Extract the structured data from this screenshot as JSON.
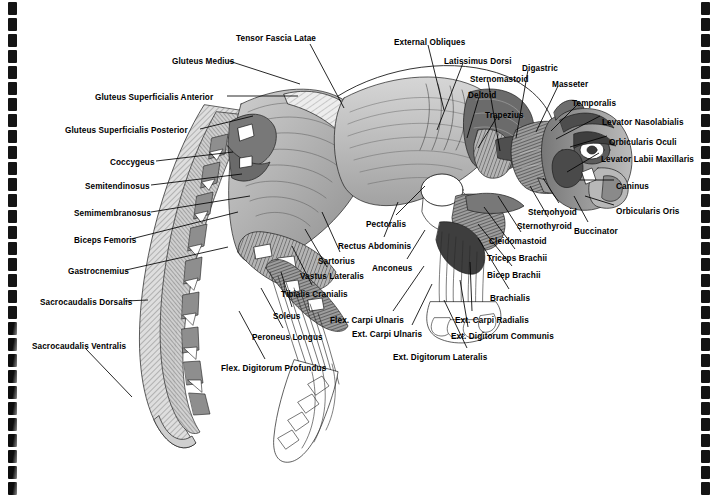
{
  "document": {
    "type": "anatomical-illustration",
    "subject": "Cat superficial musculature — lateral view",
    "page_background": "#ffffff",
    "ink_color": "#000000",
    "binding": {
      "style": "spiral-comb",
      "left_holes": 31,
      "right_holes": 31
    }
  },
  "labels": [
    {
      "id": "tensor-fascia-latae",
      "text": "Tensor Fascia Latae",
      "x": 236,
      "y": 34,
      "align": "left",
      "lx": 310,
      "ly": 44,
      "tx": 344,
      "ty": 108
    },
    {
      "id": "gluteus-medius",
      "text": "Gluteus Medius",
      "x": 172,
      "y": 57,
      "align": "left",
      "lx": 229,
      "ly": 61,
      "tx": 300,
      "ty": 84
    },
    {
      "id": "gluteus-superficialis-anterior",
      "text": "Gluteus Superficialis Anterior",
      "x": 95,
      "y": 93,
      "align": "left",
      "lx": 227,
      "ly": 96,
      "tx": 298,
      "ty": 96
    },
    {
      "id": "gluteus-superficialis-posterior",
      "text": "Gluteus Superficialis Posterior",
      "x": 65,
      "y": 126,
      "align": "left",
      "lx": 200,
      "ly": 129,
      "tx": 253,
      "ty": 116
    },
    {
      "id": "coccygeus",
      "text": "Coccygeus",
      "x": 110,
      "y": 158,
      "align": "left",
      "lx": 156,
      "ly": 161,
      "tx": 233,
      "ty": 152
    },
    {
      "id": "semitendinosus",
      "text": "Semitendinosus",
      "x": 85,
      "y": 182,
      "align": "left",
      "lx": 151,
      "ly": 185,
      "tx": 242,
      "ty": 174
    },
    {
      "id": "semimembranosus",
      "text": "Semimembranosus",
      "x": 74,
      "y": 209,
      "align": "left",
      "lx": 151,
      "ly": 212,
      "tx": 250,
      "ty": 196
    },
    {
      "id": "biceps-femoris",
      "text": "Biceps Femoris",
      "x": 74,
      "y": 236,
      "align": "left",
      "lx": 131,
      "ly": 239,
      "tx": 238,
      "ty": 212
    },
    {
      "id": "gastrocnemius",
      "text": "Gastrocnemius",
      "x": 68,
      "y": 267,
      "align": "left",
      "lx": 126,
      "ly": 270,
      "tx": 228,
      "ty": 247
    },
    {
      "id": "sacrocaudalis-dorsalis",
      "text": "Sacrocaudalis Dorsalis",
      "x": 40,
      "y": 298,
      "align": "left",
      "lx": 125,
      "ly": 301,
      "tx": 148,
      "ty": 300
    },
    {
      "id": "sacrocaudalis-ventralis",
      "text": "Sacrocaudalis Ventralis",
      "x": 32,
      "y": 342,
      "align": "left",
      "lx": 86,
      "ly": 349,
      "tx": 132,
      "ty": 397
    },
    {
      "id": "flex-digitorum-profundus",
      "text": "Flex. Digitorum Profundus",
      "x": 221,
      "y": 364,
      "align": "left",
      "lx": 265,
      "ly": 359,
      "tx": 239,
      "ty": 311
    },
    {
      "id": "peroneus-longus",
      "text": "Peroneus Longus",
      "x": 252,
      "y": 333,
      "align": "left",
      "lx": 283,
      "ly": 328,
      "tx": 261,
      "ty": 288
    },
    {
      "id": "soleus",
      "text": "Soleus",
      "x": 273,
      "y": 312,
      "align": "left",
      "lx": 292,
      "ly": 307,
      "tx": 281,
      "ty": 272
    },
    {
      "id": "tibialis-cranialis",
      "text": "Tibialis Cranialis",
      "x": 281,
      "y": 290,
      "align": "left",
      "lx": 312,
      "ly": 285,
      "tx": 292,
      "ty": 246
    },
    {
      "id": "vastus-lateralis",
      "text": "Vastus Lateralis",
      "x": 300,
      "y": 272,
      "align": "left",
      "lx": 327,
      "ly": 267,
      "tx": 305,
      "ty": 229
    },
    {
      "id": "sartorius",
      "text": "Sartorius",
      "x": 318,
      "y": 257,
      "align": "left",
      "lx": 340,
      "ly": 252,
      "tx": 322,
      "ty": 212
    },
    {
      "id": "rectus-abdominis",
      "text": "Rectus Abdominis",
      "x": 338,
      "y": 242,
      "align": "left",
      "lx": 384,
      "ly": 237,
      "tx": 398,
      "ty": 202
    },
    {
      "id": "pectoralis",
      "text": "Pectoralis",
      "x": 366,
      "y": 220,
      "align": "left",
      "lx": 396,
      "ly": 215,
      "tx": 425,
      "ty": 186
    },
    {
      "id": "anconeus",
      "text": "Anconeus",
      "x": 372,
      "y": 264,
      "align": "left",
      "lx": 407,
      "ly": 259,
      "tx": 425,
      "ty": 230
    },
    {
      "id": "flex-carpi-ulnaris",
      "text": "Flex. Carpi Ulnaris",
      "x": 330,
      "y": 316,
      "align": "left",
      "lx": 393,
      "ly": 311,
      "tx": 424,
      "ty": 266
    },
    {
      "id": "ext-carpi-ulnaris",
      "text": "Ext. Carpi Ulnaris",
      "x": 352,
      "y": 330,
      "align": "left",
      "lx": 412,
      "ly": 325,
      "tx": 432,
      "ty": 284
    },
    {
      "id": "ext-digitorum-lateralis",
      "text": "Ext. Digitorum Lateralis",
      "x": 393,
      "y": 353,
      "align": "left",
      "lx": 467,
      "ly": 348,
      "tx": 444,
      "ty": 300
    },
    {
      "id": "ext-digitorum-communis",
      "text": "Ext. Digitorum Communis",
      "x": 451,
      "y": 332,
      "align": "left",
      "lx": 468,
      "ly": 327,
      "tx": 460,
      "ty": 280
    },
    {
      "id": "ext-carpi-radialis",
      "text": "Ext. Carpi Radialis",
      "x": 455,
      "y": 316,
      "align": "left",
      "lx": 472,
      "ly": 311,
      "tx": 470,
      "ty": 262
    },
    {
      "id": "brachialis",
      "text": "Brachialis",
      "x": 490,
      "y": 294,
      "align": "left",
      "lx": 509,
      "ly": 289,
      "tx": 478,
      "ty": 238
    },
    {
      "id": "bicep-brachii",
      "text": "Bicep Brachii",
      "x": 487,
      "y": 271,
      "align": "left",
      "lx": 512,
      "ly": 266,
      "tx": 478,
      "ty": 224
    },
    {
      "id": "triceps-brachii",
      "text": "Triceps Brachii",
      "x": 487,
      "y": 254,
      "align": "left",
      "lx": 515,
      "ly": 249,
      "tx": 484,
      "ty": 207
    },
    {
      "id": "cleidomastoid",
      "text": "Cleidomastoid",
      "x": 489,
      "y": 237,
      "align": "left",
      "lx": 521,
      "ly": 232,
      "tx": 498,
      "ty": 196
    },
    {
      "id": "sternothyroid",
      "text": "Sternothyroid",
      "x": 517,
      "y": 222,
      "align": "left",
      "lx": 548,
      "ly": 217,
      "tx": 530,
      "ty": 186
    },
    {
      "id": "sternohyoid",
      "text": "Sternohyoid",
      "x": 528,
      "y": 208,
      "align": "left",
      "lx": 559,
      "ly": 203,
      "tx": 543,
      "ty": 178
    },
    {
      "id": "buccinator",
      "text": "Buccinator",
      "x": 574,
      "y": 227,
      "align": "left",
      "lx": 588,
      "ly": 222,
      "tx": 574,
      "ty": 196
    },
    {
      "id": "orbicularis-oris",
      "text": "Orbicularis Oris",
      "x": 616,
      "y": 207,
      "align": "left",
      "lx": 614,
      "ly": 205,
      "tx": 585,
      "ty": 196
    },
    {
      "id": "caninus",
      "text": "Caninus",
      "x": 616,
      "y": 182,
      "align": "left",
      "lx": 614,
      "ly": 180,
      "tx": 580,
      "ty": 180
    },
    {
      "id": "levator-labii-maxillaris",
      "text": "Levator Labii Maxillaris",
      "x": 601,
      "y": 155,
      "align": "left",
      "lx": 599,
      "ly": 153,
      "tx": 567,
      "ty": 172
    },
    {
      "id": "orbicularis-oculi",
      "text": "Orbicularis Oculi",
      "x": 609,
      "y": 138,
      "align": "left",
      "lx": 607,
      "ly": 136,
      "tx": 570,
      "ty": 147
    },
    {
      "id": "levator-nasolabialis",
      "text": "Levator Nasolabialis",
      "x": 602,
      "y": 118,
      "align": "left",
      "lx": 600,
      "ly": 116,
      "tx": 556,
      "ty": 139
    },
    {
      "id": "temporalis",
      "text": "Temporalis",
      "x": 572,
      "y": 99,
      "align": "left",
      "lx": 578,
      "ly": 104,
      "tx": 551,
      "ty": 131
    },
    {
      "id": "masseter",
      "text": "Masseter",
      "x": 552,
      "y": 80,
      "align": "left",
      "lx": 558,
      "ly": 86,
      "tx": 536,
      "ty": 132
    },
    {
      "id": "digastric",
      "text": "Digastric",
      "x": 522,
      "y": 64,
      "align": "left",
      "lx": 528,
      "ly": 70,
      "tx": 516,
      "ty": 138
    },
    {
      "id": "sternomastoid",
      "text": "Sternomastoid",
      "x": 470,
      "y": 75,
      "align": "left",
      "lx": 488,
      "ly": 81,
      "tx": 500,
      "ty": 151
    },
    {
      "id": "deltoid",
      "text": "Deltoid",
      "x": 468,
      "y": 91,
      "align": "left",
      "lx": 479,
      "ly": 97,
      "tx": 467,
      "ty": 138
    },
    {
      "id": "trapezius",
      "text": "Trapezius",
      "x": 485,
      "y": 111,
      "align": "left",
      "lx": 497,
      "ly": 117,
      "tx": 478,
      "ty": 148
    },
    {
      "id": "latissimus-dorsi",
      "text": "Latissimus Dorsi",
      "x": 444,
      "y": 57,
      "align": "left",
      "lx": 463,
      "ly": 63,
      "tx": 437,
      "ty": 130
    },
    {
      "id": "external-obliques",
      "text": "External Obliques",
      "x": 394,
      "y": 38,
      "align": "left",
      "lx": 428,
      "ly": 45,
      "tx": 444,
      "ty": 110
    }
  ],
  "figure": {
    "outline_color": "#1a1a1a",
    "fill_light": "#f2f2f2",
    "fill_mid": "#b9b9b9",
    "fill_dark": "#6e6e6e",
    "fill_darker": "#4a4a4a"
  }
}
